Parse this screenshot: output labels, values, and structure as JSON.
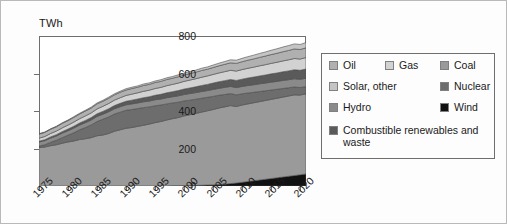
{
  "axis": {
    "y_unit_label": "TWh",
    "y_ticks": [
      "800",
      "600",
      "400",
      "200",
      "0"
    ],
    "x_ticks": [
      "1975",
      "1980",
      "1985",
      "1990",
      "1995",
      "2000",
      "2005",
      "2010",
      "2015",
      "2020"
    ]
  },
  "legend": {
    "items": [
      {
        "label": "Oil",
        "color": "#b0b0b0"
      },
      {
        "label": "Gas",
        "color": "#d2d2d2"
      },
      {
        "label": "Coal",
        "color": "#9a9a9a"
      },
      {
        "label": "Solar, other",
        "color": "#c4c4c4"
      },
      {
        "label": "Nuclear",
        "color": "#6d6d6d"
      },
      {
        "label": "Hydro",
        "color": "#8a8a8a"
      },
      {
        "label": "Wind",
        "color": "#111111"
      },
      {
        "label": "Combustible renewables and waste",
        "color": "#5a5a5a"
      }
    ]
  },
  "chart_data": {
    "type": "area",
    "stacked": true,
    "title": "",
    "xlabel": "",
    "ylabel": "TWh",
    "ylim": [
      0,
      800
    ],
    "xlim": [
      1975,
      2021
    ],
    "grid": false,
    "legend_position": "right",
    "x": [
      1975,
      1976,
      1977,
      1978,
      1979,
      1980,
      1981,
      1982,
      1983,
      1984,
      1985,
      1986,
      1987,
      1988,
      1989,
      1990,
      1991,
      1992,
      1993,
      1994,
      1995,
      1996,
      1997,
      1998,
      1999,
      2000,
      2001,
      2002,
      2003,
      2004,
      2005,
      2006,
      2007,
      2008,
      2009,
      2010,
      2011,
      2012,
      2013,
      2014,
      2015,
      2016,
      2017,
      2018,
      2019,
      2020,
      2021
    ],
    "stack_order_bottom_to_top": [
      "Wind",
      "Coal",
      "Nuclear",
      "Hydro",
      "Combustible renewables and waste",
      "Gas",
      "Oil",
      "Solar, other"
    ],
    "series": [
      {
        "name": "Wind",
        "values": [
          0,
          0,
          0,
          0,
          0,
          0,
          0,
          0,
          0,
          0,
          0,
          0,
          0,
          0,
          0,
          0,
          0,
          0,
          0,
          0,
          0,
          0,
          0,
          1,
          1,
          2,
          2,
          3,
          4,
          5,
          6,
          8,
          10,
          13,
          16,
          20,
          24,
          28,
          32,
          36,
          40,
          44,
          48,
          52,
          56,
          60,
          64
        ]
      },
      {
        "name": "Coal",
        "values": [
          205,
          208,
          215,
          220,
          228,
          235,
          240,
          248,
          252,
          258,
          268,
          272,
          280,
          292,
          300,
          308,
          312,
          318,
          324,
          330,
          338,
          344,
          352,
          358,
          364,
          372,
          378,
          384,
          390,
          396,
          402,
          408,
          412,
          416,
          408,
          412,
          414,
          416,
          418,
          420,
          422,
          424,
          426,
          428,
          430,
          425,
          428
        ]
      },
      {
        "name": "Nuclear",
        "values": [
          8,
          12,
          18,
          24,
          30,
          36,
          44,
          52,
          60,
          68,
          76,
          84,
          88,
          92,
          94,
          96,
          96,
          95,
          94,
          92,
          90,
          88,
          86,
          84,
          82,
          80,
          78,
          76,
          74,
          72,
          70,
          68,
          66,
          64,
          62,
          60,
          58,
          56,
          54,
          52,
          50,
          48,
          46,
          44,
          42,
          40,
          38
        ]
      },
      {
        "name": "Hydro",
        "values": [
          22,
          22,
          23,
          23,
          24,
          24,
          25,
          25,
          26,
          26,
          27,
          27,
          28,
          28,
          29,
          29,
          30,
          30,
          31,
          31,
          32,
          32,
          33,
          33,
          34,
          34,
          35,
          35,
          36,
          36,
          37,
          37,
          38,
          38,
          39,
          39,
          40,
          40,
          41,
          41,
          42,
          42,
          43,
          43,
          44,
          44,
          45
        ]
      },
      {
        "name": "Combustible renewables and waste",
        "values": [
          4,
          5,
          6,
          7,
          8,
          9,
          10,
          11,
          12,
          13,
          14,
          15,
          16,
          17,
          18,
          19,
          20,
          21,
          22,
          23,
          24,
          25,
          26,
          27,
          28,
          29,
          30,
          31,
          32,
          33,
          34,
          35,
          36,
          37,
          38,
          39,
          40,
          41,
          42,
          43,
          44,
          45,
          46,
          47,
          48,
          48,
          49
        ]
      },
      {
        "name": "Gas",
        "values": [
          16,
          17,
          18,
          19,
          20,
          21,
          22,
          23,
          24,
          25,
          26,
          27,
          28,
          29,
          30,
          31,
          32,
          33,
          34,
          35,
          36,
          37,
          38,
          39,
          40,
          41,
          42,
          43,
          44,
          45,
          46,
          47,
          48,
          49,
          50,
          51,
          52,
          53,
          54,
          55,
          56,
          57,
          58,
          59,
          60,
          60,
          61
        ]
      },
      {
        "name": "Oil",
        "values": [
          22,
          22,
          23,
          23,
          24,
          24,
          25,
          25,
          26,
          26,
          27,
          27,
          28,
          28,
          29,
          29,
          30,
          30,
          31,
          31,
          32,
          32,
          33,
          33,
          34,
          34,
          35,
          35,
          36,
          36,
          37,
          38,
          39,
          40,
          41,
          42,
          43,
          44,
          45,
          46,
          47,
          48,
          49,
          50,
          51,
          51,
          52
        ]
      },
      {
        "name": "Solar, other",
        "values": [
          2,
          2,
          2,
          3,
          3,
          3,
          4,
          4,
          4,
          5,
          5,
          5,
          6,
          6,
          6,
          7,
          7,
          7,
          8,
          8,
          8,
          9,
          9,
          9,
          10,
          10,
          11,
          11,
          12,
          12,
          13,
          14,
          15,
          16,
          17,
          18,
          19,
          20,
          21,
          22,
          23,
          24,
          25,
          26,
          27,
          27,
          28
        ]
      }
    ]
  }
}
